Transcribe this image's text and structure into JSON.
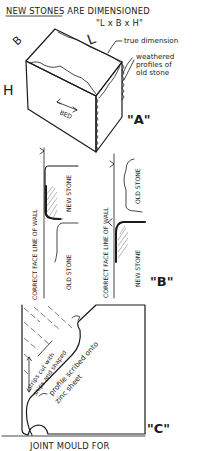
{
  "figure_a": {
    "title": "NEW STONES ARE DIMENSIONED",
    "formula": "\"L x B x H\"",
    "dim_labels": {
      "length": "L",
      "breadth": "B",
      "height": "H"
    },
    "bed_label": "BED",
    "annotation_true_dimension": "true dimension",
    "annotation_weathered": [
      "weathered",
      "profiles of",
      "old stone"
    ],
    "label": "\"A\""
  },
  "figure_b": {
    "left_panel": {
      "face_line_label": "CORRECT FACE LINE OF WALL",
      "upper_stone": "NEW STONE",
      "lower_stone": "OLD STONE"
    },
    "right_panel": {
      "face_line_label": "CORRECT FACE LINE OF WALL",
      "upper_stone": "OLD STONE",
      "lower_stone": "NEW STONE"
    },
    "label": "\"B\""
  },
  "figure_c": {
    "annotation_strips": [
      "strips cut with",
      "snips and shaped"
    ],
    "annotation_profile": [
      "profile scribed onto",
      "zinc sheet"
    ],
    "label": "\"C\"",
    "caption": "JOINT MOULD FOR"
  },
  "colors": {
    "ink": "#1a1a1a",
    "hatch": "#8a8a8a",
    "paper": "#ffffff"
  }
}
